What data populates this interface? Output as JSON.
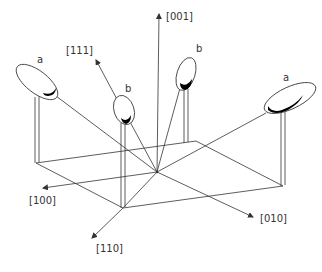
{
  "diagram": {
    "title": "",
    "colors": {
      "line": "#333333",
      "fill": "#ffffff",
      "crescent": "#000000"
    },
    "axes": [
      {
        "id": "001",
        "label": "[001]"
      },
      {
        "id": "111",
        "label": "[111]"
      },
      {
        "id": "100",
        "label": "[100]"
      },
      {
        "id": "010",
        "label": "[010]"
      },
      {
        "id": "110",
        "label": "[110]"
      }
    ],
    "ellipses": [
      {
        "id": "ellipse-left-a",
        "letter": "a"
      },
      {
        "id": "ellipse-left-b",
        "letter": "b"
      },
      {
        "id": "ellipse-right-b",
        "letter": "b"
      },
      {
        "id": "ellipse-right-a",
        "letter": "a"
      }
    ]
  }
}
